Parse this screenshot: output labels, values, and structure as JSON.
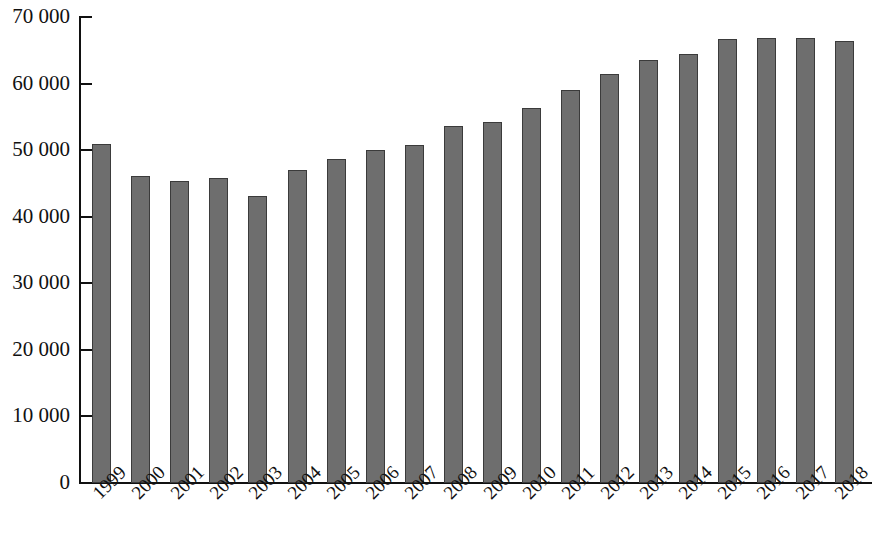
{
  "chart_data": {
    "type": "bar",
    "title": "",
    "subtitle": "",
    "xlabel": "",
    "ylabel": "",
    "categories": [
      "1999",
      "2000",
      "2001",
      "2002",
      "2003",
      "2004",
      "2005",
      "2006",
      "2007",
      "2008",
      "2009",
      "2010",
      "2011",
      "2012",
      "2013",
      "2014",
      "2015",
      "2016",
      "2017",
      "2018"
    ],
    "values": [
      50900,
      46100,
      45300,
      45800,
      43100,
      47000,
      48600,
      50000,
      50700,
      53700,
      54200,
      56300,
      59100,
      61500,
      63500,
      64400,
      66700,
      66800,
      66900,
      66400
    ],
    "ylim": [
      0,
      70000
    ],
    "y_ticks": [
      0,
      10000,
      20000,
      30000,
      40000,
      50000,
      60000,
      70000
    ],
    "y_tick_labels": [
      "0",
      "10 000",
      "20 000",
      "30 000",
      "40 000",
      "50 000",
      "60 000",
      "70 000"
    ],
    "grid": false,
    "legend": null,
    "legend_position": "none",
    "annotations": [],
    "x_tick_label_rotation": -45,
    "bar_fill_color": "#6e6e6e",
    "bar_border_color": "#3b3b3b",
    "axis_color": "#111111",
    "background_color": "#ffffff"
  }
}
